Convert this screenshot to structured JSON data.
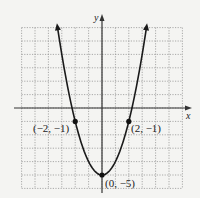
{
  "chart_data": {
    "type": "line",
    "title": "",
    "function": "y = x^2 - 5",
    "xlabel": "x",
    "ylabel": "y",
    "xlim": [
      -6,
      6
    ],
    "ylim": [
      -6,
      6
    ],
    "grid": true,
    "grid_step": 1,
    "series": [
      {
        "name": "parabola",
        "x": [
          -3.3,
          -3,
          -2,
          -1,
          0,
          1,
          2,
          3,
          3.3
        ],
        "y": [
          5.89,
          4,
          -1,
          -4,
          -5,
          -4,
          -1,
          4,
          5.89
        ]
      }
    ],
    "points": [
      {
        "x": -2,
        "y": -1,
        "label": "(−2, −1)"
      },
      {
        "x": 2,
        "y": -1,
        "label": "(2, −1)"
      },
      {
        "x": 0,
        "y": -5,
        "label": "(0, −5)"
      }
    ]
  },
  "labels": {
    "x_axis": "x",
    "y_axis": "y",
    "p_left": "(−2, −1)",
    "p_right": "(2, −1)",
    "p_vertex": "(0, −5)"
  },
  "colors": {
    "curve": "#1a1a1a",
    "grid": "#8a8a8a",
    "axis": "#333333",
    "background": "#f4f4f2"
  }
}
